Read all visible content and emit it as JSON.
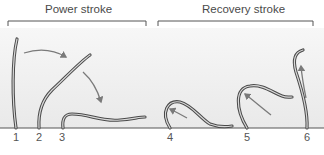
{
  "figure": {
    "brackets": [
      {
        "label": "Power stroke"
      },
      {
        "label": "Recovery stroke"
      }
    ],
    "positions": [
      "1",
      "2",
      "3",
      "4",
      "5",
      "6"
    ],
    "colors": {
      "cilium_outline": "#4a4a4a",
      "cilium_fill": "#d8d8d8",
      "arrow": "#7a7a7a",
      "panel_top": "#f4f4f4",
      "panel_bottom": "#ebebeb",
      "baseline": "#555555",
      "text": "#4a4a4a"
    }
  }
}
